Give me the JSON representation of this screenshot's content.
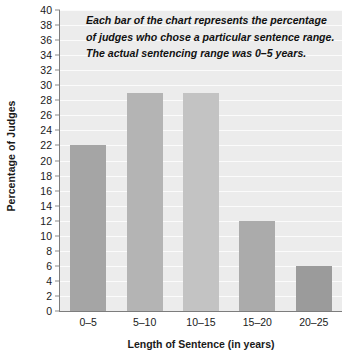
{
  "chart_data": {
    "type": "bar",
    "title": "",
    "subtitle": "",
    "categories": [
      "0–5",
      "5–10",
      "10–15",
      "15–20",
      "20–25"
    ],
    "values": [
      22,
      29,
      29,
      12,
      6
    ],
    "series": [
      {
        "name": "Percentage of Judges",
        "values": [
          22,
          29,
          29,
          12,
          6
        ]
      }
    ],
    "xlabel": "Length of Sentence (in years)",
    "ylabel": "Percentage of Judges",
    "ylim": [
      0,
      40
    ],
    "ytick_step": 2,
    "yticks": [
      0,
      2,
      4,
      6,
      8,
      10,
      12,
      14,
      16,
      18,
      20,
      22,
      24,
      26,
      28,
      30,
      32,
      34,
      36,
      38,
      40
    ],
    "ytick_labels": [
      "0",
      "2",
      "4",
      "6",
      "8",
      "10",
      "12",
      "14",
      "16",
      "18",
      "20",
      "22",
      "24",
      "26",
      "28",
      "30",
      "32",
      "34",
      "36",
      "38",
      "40"
    ],
    "grid": true,
    "grid_axis": "y",
    "legend": false,
    "legend_position": "none",
    "annotations": [
      "Each bar of the chart represents the percentage",
      "of judges who chose a particular sentence range.",
      "The actual sentencing range was 0–5 years."
    ],
    "bar_colors": [
      "#a5a5a5",
      "#b4b4b4",
      "#c3c3c3",
      "#ababab",
      "#9b9b9b"
    ],
    "colors": {
      "plot_background": "#ececec",
      "gridline": "#fbfbfb",
      "axis_line": "#7d7d7d",
      "text": "#1a1a1a",
      "figure_background": "#ffffff"
    }
  }
}
